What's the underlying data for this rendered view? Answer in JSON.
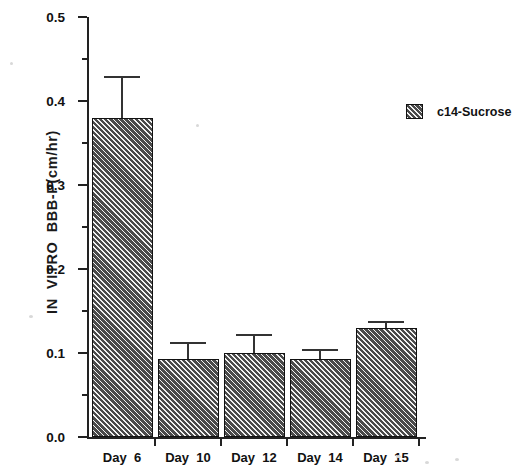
{
  "chart_data": {
    "type": "bar",
    "title": "",
    "subtitle": "",
    "xlabel": "",
    "ylabel": "IN  VITRO  BBB-P(cm/hr)",
    "categories": [
      "Day  6",
      "Day  10",
      "Day  12",
      "Day  14",
      "Day  15"
    ],
    "series": [
      {
        "name": "c14-Sucrose",
        "values": [
          0.38,
          0.093,
          0.1,
          0.093,
          0.13
        ],
        "errors": [
          0.05,
          0.02,
          0.023,
          0.012,
          0.008
        ]
      }
    ],
    "ylim": [
      0.0,
      0.5
    ],
    "ytick_labels": [
      "0.0",
      "0.1",
      "0.2",
      "0.3",
      "0.4",
      "0.5"
    ],
    "ytick_values": [
      0.0,
      0.1,
      0.2,
      0.3,
      0.4,
      0.5
    ],
    "yminor_values": [
      0.05,
      0.15,
      0.25,
      0.35,
      0.45
    ],
    "grid": false,
    "legend_position": "upper-right",
    "bar_fill_color": "#4a4a4a",
    "bar_edge_color": "#111111",
    "axis_color": "#222222"
  },
  "legend": {
    "entries": [
      {
        "label": "c14-Sucrose",
        "swatch": "hatched-square"
      }
    ]
  }
}
